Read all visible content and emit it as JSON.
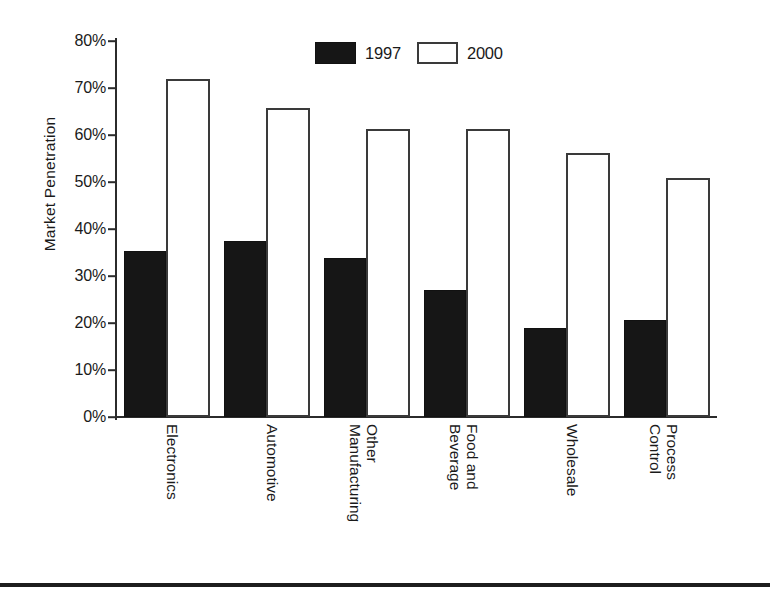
{
  "chart_data": {
    "type": "bar",
    "title": "",
    "xlabel": "",
    "ylabel": "Market Penetration",
    "categories": [
      "Electronics",
      "Automotive",
      "Other\nManufacturing",
      "Food and\nBeverage",
      "Wholesale",
      "Process\nControl"
    ],
    "series": [
      {
        "name": "1997",
        "values": [
          35,
          37,
          33.5,
          26.5,
          18.5,
          20.3
        ],
        "color": "#161616",
        "style": "filled"
      },
      {
        "name": "2000",
        "values": [
          71,
          65,
          60.5,
          60.5,
          55.3,
          50
        ],
        "color": "#ffffff",
        "style": "hollow-outline"
      }
    ],
    "ylim": [
      0,
      80
    ],
    "ytick_values": [
      0,
      10,
      20,
      30,
      40,
      50,
      60,
      70,
      80
    ],
    "ytick_labels": [
      "0%",
      "10%",
      "20%",
      "30%",
      "40%",
      "50%",
      "60%",
      "70%",
      "80%"
    ],
    "grid": false,
    "legend_position": "top-center",
    "value_format": "percent"
  },
  "legend": {
    "entries": [
      {
        "label": "1997",
        "swatch": "filled-black-square"
      },
      {
        "label": "2000",
        "swatch": "hollow-white-square"
      }
    ]
  },
  "axes": {
    "y_title": "Market Penetration"
  }
}
